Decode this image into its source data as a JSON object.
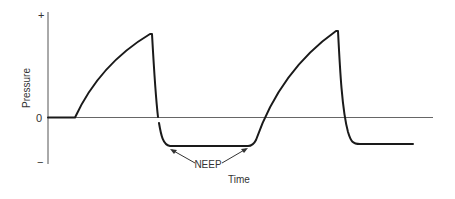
{
  "diagram": {
    "y_axis": {
      "label": "Pressure",
      "tick_top": "+",
      "tick_zero": "0",
      "tick_bottom": "−"
    },
    "x_axis": {
      "label": "Time"
    },
    "annotation": {
      "label": "NEEP"
    },
    "colors": {
      "curve": "#1a1a1a",
      "axis": "#555555",
      "text": "#333333"
    }
  }
}
